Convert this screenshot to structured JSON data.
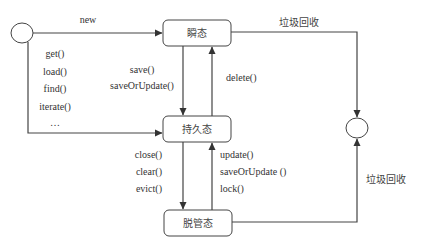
{
  "diagram": {
    "type": "state-diagram",
    "states": {
      "transient": "瞬态",
      "persistent": "持久态",
      "detached": "脱管态"
    },
    "transitions": {
      "start_to_transient": "new",
      "start_to_persistent": [
        "get()",
        "load()",
        "find()",
        "iterate()",
        "…"
      ],
      "transient_to_persistent": [
        "save()",
        "saveOrUpdate()"
      ],
      "persistent_to_transient": [
        "delete()"
      ],
      "persistent_to_detached": [
        "close()",
        "clear()",
        "evict()"
      ],
      "detached_to_persistent": [
        "update()",
        "saveOrUpdate ()",
        "lock()"
      ],
      "transient_to_end": "垃圾回收",
      "detached_to_end": "垃圾回收"
    }
  }
}
